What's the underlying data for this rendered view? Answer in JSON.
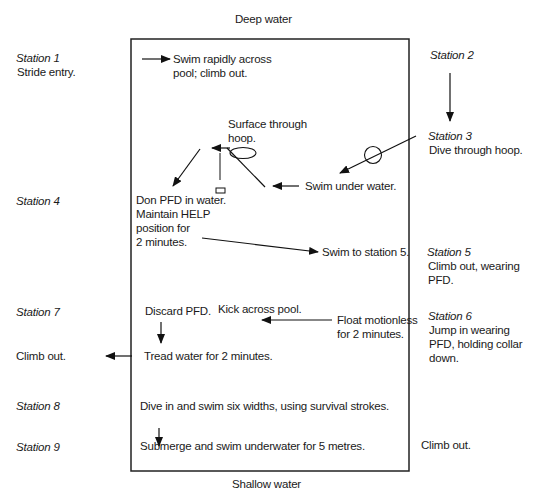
{
  "pool": {
    "top_label": "Deep water",
    "bottom_label": "Shallow water",
    "border_color": "#222222"
  },
  "stations": [
    {
      "id": 1,
      "label": "Station 1",
      "text": [
        "Stride entry."
      ]
    },
    {
      "id": 2,
      "label": "Station 2",
      "text": []
    },
    {
      "id": 3,
      "label": "Station 3",
      "text": [
        "Dive through hoop."
      ]
    },
    {
      "id": 4,
      "label": "Station 4",
      "text": []
    },
    {
      "id": 5,
      "label": "Station 5",
      "text": [
        "Climb out, wearing",
        "PFD."
      ]
    },
    {
      "id": 6,
      "label": "Station 6",
      "text": [
        "Jump in wearing",
        "PFD, holding collar",
        "down."
      ]
    },
    {
      "id": 7,
      "label": "Station 7",
      "text": []
    },
    {
      "id": 8,
      "label": "Station 8",
      "text": []
    },
    {
      "id": 9,
      "label": "Station 9",
      "text": []
    }
  ],
  "instructions": {
    "swim_rapidly": [
      "Swim rapidly across",
      "pool; climb out."
    ],
    "surface_hoop": [
      "Surface through",
      "hoop."
    ],
    "swim_under": "Swim under water.",
    "don_pfd": [
      "Don PFD in water.",
      "Maintain HELP",
      "position for",
      "2 minutes."
    ],
    "swim_to_5": "Swim to station 5.",
    "discard_pfd": "Discard PFD.",
    "kick_across": "Kick across pool.",
    "float": [
      "Float motionless",
      "for 2 minutes."
    ],
    "tread": "Tread water for 2 minutes.",
    "climb_out_left": "Climb out.",
    "dive_six": "Dive in and swim six widths, using survival strokes.",
    "submerge": "Submerge and swim underwater for 5 metres.",
    "climb_out_right": "Climb out."
  }
}
